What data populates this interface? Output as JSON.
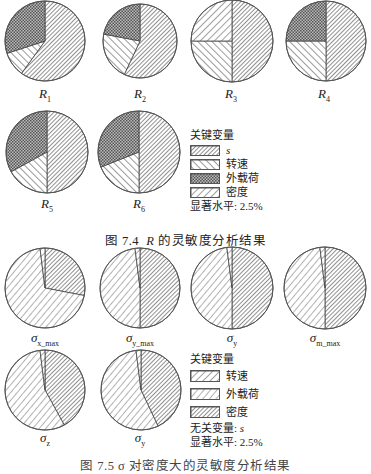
{
  "figure_top": {
    "caption_prefix": "图 7.4",
    "caption_var": "R",
    "caption_suffix": "的灵敏度分析结果",
    "legend": {
      "title": "关键变量",
      "items": [
        {
          "label": "s",
          "pattern": "dense-diag"
        },
        {
          "label": "转速",
          "pattern": "wide-diag-back"
        },
        {
          "label": "外载荷",
          "pattern": "crosshatch"
        },
        {
          "label": "密度",
          "pattern": "wide-diag-fwd"
        }
      ],
      "significance": "显著水平: 2.5%"
    },
    "pies": [
      {
        "label": "R",
        "sub": "1"
      },
      {
        "label": "R",
        "sub": "2"
      },
      {
        "label": "R",
        "sub": "3"
      },
      {
        "label": "R",
        "sub": "4"
      },
      {
        "label": "R",
        "sub": "5"
      },
      {
        "label": "R",
        "sub": "6"
      }
    ]
  },
  "figure_bottom": {
    "caption_partial": "图 7.5 σ 对密度大的灵敏度分析结果",
    "legend": {
      "title": "关键变量",
      "items": [
        {
          "label": "转速",
          "pattern": "wide-diag-fwd"
        },
        {
          "label": "外载荷",
          "pattern": "wide-diag-fwd-light"
        },
        {
          "label": "密度",
          "pattern": "dense-diag"
        }
      ],
      "irrelevant": "无关变量: ",
      "irrelevant_var": "s",
      "significance": "显著水平: 2.5%"
    },
    "pies": [
      {
        "label": "σ",
        "sub": "x_max"
      },
      {
        "label": "σ",
        "sub": "y_max"
      },
      {
        "label": "σ",
        "sub": "y"
      },
      {
        "label": "σ",
        "sub": "m_max"
      },
      {
        "label": "σ",
        "sub": "z"
      },
      {
        "label": "σ",
        "sub": "y"
      }
    ]
  },
  "chart_data": [
    {
      "type": "pie",
      "title": "图 7.4 R 的灵敏度分析结果",
      "legend_title": "关键变量",
      "categories": [
        "s",
        "转速",
        "外载荷",
        "密度"
      ],
      "note": "显著水平: 2.5%",
      "series": [
        {
          "name": "R1",
          "values": [
            0.6,
            0.1,
            0.3,
            0.0
          ]
        },
        {
          "name": "R2",
          "values": [
            0.57,
            0.21,
            0.22,
            0.0
          ]
        },
        {
          "name": "R3",
          "values": [
            0.5,
            0.25,
            0.0,
            0.25
          ]
        },
        {
          "name": "R4",
          "values": [
            0.5,
            0.25,
            0.25,
            0.0
          ]
        },
        {
          "name": "R5",
          "values": [
            0.5,
            0.17,
            0.33,
            0.0
          ]
        },
        {
          "name": "R6",
          "values": [
            0.5,
            0.19,
            0.31,
            0.0
          ]
        }
      ]
    },
    {
      "type": "pie",
      "title": "图 7.5 σ 对密度大的灵敏度分析结果",
      "legend_title": "关键变量",
      "categories": [
        "转速",
        "外载荷",
        "密度"
      ],
      "note": "无关变量: s; 显著水平: 2.5%",
      "series": [
        {
          "name": "σx_max",
          "values": [
            0.02,
            0.7,
            0.28
          ]
        },
        {
          "name": "σy_max",
          "values": [
            0.02,
            0.48,
            0.5
          ]
        },
        {
          "name": "σy",
          "values": [
            0.02,
            0.48,
            0.5
          ]
        },
        {
          "name": "σm_max",
          "values": [
            0.02,
            0.48,
            0.5
          ]
        },
        {
          "name": "σz",
          "values": [
            0.02,
            0.56,
            0.42
          ]
        },
        {
          "name": "σy (2)",
          "values": [
            0.02,
            0.55,
            0.43
          ]
        }
      ]
    }
  ]
}
